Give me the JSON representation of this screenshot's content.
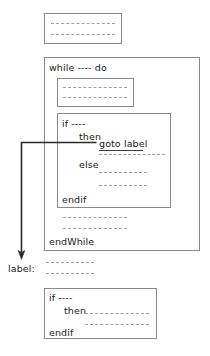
{
  "diagram": {
    "colors": {
      "box_border": "#8a8a8a",
      "text": "#1a1a1a",
      "dash": "#9a9a9a",
      "arrow": "#2b2b2b",
      "background": "#ffffff"
    },
    "blocks": {
      "top_statement_block": {
        "name": "top-statement-block",
        "code_lines": [
          "- - - - - - - - - - - -",
          "- - - - - - - - - - - -"
        ]
      },
      "while_block": {
        "name": "while-block",
        "header": "while ---- do",
        "footer": "endWhile",
        "inner_statement_block": {
          "name": "while-inner-statement-block",
          "code_lines": [
            "- - - - - - - - - - - -",
            "- - - - - - - - - - - -"
          ]
        },
        "if_block": {
          "name": "while-if-block",
          "header": "if ----",
          "then_label": "then",
          "goto_statement": "goto label",
          "then_code_lines": [
            "- - - - - - - - - - - -"
          ],
          "else_label": "else",
          "else_code_lines": [
            "- - - - - - - - -",
            "- - - - - - - - -"
          ],
          "footer": "endif"
        },
        "trailing_code_lines": [
          "- - - - - - - - - - - -",
          "- - - - - - - - - - - -"
        ]
      },
      "label_statement": {
        "name": "goto-target-label",
        "label_text": "label:",
        "code_lines": [
          "- - - - - - - - -",
          "- - - - - - - - -"
        ]
      },
      "bottom_if_block": {
        "name": "bottom-if-block",
        "header": "if ----",
        "then_label": "then",
        "then_code_lines": [
          "- - - - - - - - - - - -",
          "- - - - - - - - - - - -"
        ],
        "footer": "endif"
      }
    },
    "arrow": {
      "name": "goto-jump-arrow",
      "from": "goto label",
      "to": "label:",
      "description": "jump out of while loop to label"
    }
  }
}
